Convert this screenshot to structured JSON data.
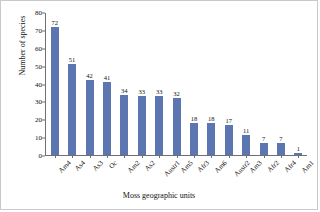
{
  "chart_data": {
    "type": "bar",
    "title": "",
    "xlabel": "Moss geographic units",
    "ylabel": "Number of species",
    "categories": [
      "Am4",
      "As4",
      "As3",
      "Oc",
      "Am2",
      "As2",
      "Austr1",
      "Am5",
      "Afr3",
      "Am6",
      "Austr2",
      "Am3",
      "Afr2",
      "Afr4",
      "Am1"
    ],
    "values": [
      72,
      51,
      42,
      41,
      34,
      33,
      33,
      32,
      18,
      18,
      17,
      11,
      7,
      7,
      1
    ],
    "ylim": [
      0,
      80
    ],
    "yticks": [
      0,
      10,
      20,
      30,
      40,
      50,
      60,
      70,
      80
    ],
    "grid": false,
    "legend": null,
    "bar_color": "#5b76b0",
    "axis_color": "#6f6f6f",
    "data_labels": true
  }
}
